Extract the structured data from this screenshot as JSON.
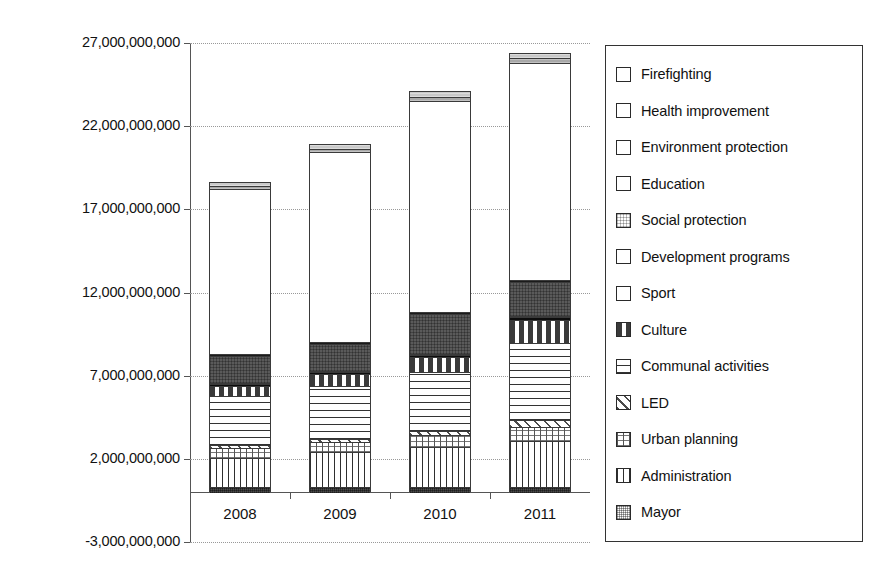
{
  "chart_data": {
    "type": "bar",
    "stacked": true,
    "title": "",
    "xlabel": "",
    "ylabel": "",
    "categories": [
      "2008",
      "2009",
      "2010",
      "2011"
    ],
    "ylim": [
      -3000000000,
      27000000000
    ],
    "ytick_values": [
      27000000000,
      22000000000,
      17000000000,
      12000000000,
      7000000000,
      2000000000,
      -3000000000
    ],
    "ytick_labels": [
      "27,000,000,000",
      "22,000,000,000",
      "17,000,000,000",
      "12,000,000,000",
      "7,000,000,000",
      "2,000,000,000",
      "-3,000,000,000"
    ],
    "grid": true,
    "legend_position": "right",
    "series": [
      {
        "name": "Mayor",
        "key": "mayor",
        "color": "#4a4a4a",
        "pattern": "solid-dark",
        "values": [
          300000000,
          300000000,
          320000000,
          330000000
        ]
      },
      {
        "name": "Administration",
        "key": "admin",
        "color": "#ffffff",
        "pattern": "vertical-lines",
        "values": [
          1750000000,
          2100000000,
          2380000000,
          2750000000
        ]
      },
      {
        "name": "Urban planning",
        "key": "urban",
        "color": "#ffffff",
        "pattern": "dotted-grid",
        "values": [
          600000000,
          600000000,
          720000000,
          840000000
        ]
      },
      {
        "name": "LED",
        "key": "led",
        "color": "#ffffff",
        "pattern": "diagonal-hatch",
        "values": [
          180000000,
          180000000,
          240000000,
          420000000
        ]
      },
      {
        "name": "Communal activities",
        "key": "communal",
        "color": "#ffffff",
        "pattern": "horizontal-lines",
        "values": [
          2950000000,
          3200000000,
          3550000000,
          4650000000
        ]
      },
      {
        "name": "Culture",
        "key": "culture",
        "color": "#ffffff",
        "pattern": "dash-marks",
        "values": [
          600000000,
          720000000,
          900000000,
          1380000000
        ]
      },
      {
        "name": "Sport",
        "key": "sport",
        "color": "#0d0d0d",
        "pattern": "solid-black",
        "values": [
          120000000,
          120000000,
          120000000,
          180000000
        ]
      },
      {
        "name": "Development programs",
        "key": "devprog",
        "color": "#9a9a9a",
        "pattern": "light-gray",
        "values": [
          60000000,
          60000000,
          60000000,
          60000000
        ]
      },
      {
        "name": "Social protection",
        "key": "social",
        "color": "#5a5a5a",
        "pattern": "dark-gray",
        "values": [
          1620000000,
          1620000000,
          2400000000,
          2040000000
        ]
      },
      {
        "name": "Environment protection",
        "key": "envprot",
        "color": "#1b1b1b",
        "pattern": "very-dark",
        "values": [
          120000000,
          120000000,
          120000000,
          120000000
        ]
      },
      {
        "name": "Education",
        "key": "education",
        "color": "#ffffff",
        "pattern": "white",
        "values": [
          9900000000,
          11400000000,
          12700000000,
          13050000000
        ]
      },
      {
        "name": "Health improvement",
        "key": "health",
        "color": "#a8a8a8",
        "pattern": "medium-gray",
        "values": [
          180000000,
          180000000,
          240000000,
          300000000
        ]
      },
      {
        "name": "Firefighting",
        "key": "fire",
        "color": "#c9c9c9",
        "pattern": "light-gray",
        "values": [
          240000000,
          300000000,
          360000000,
          300000000
        ]
      }
    ],
    "totals": [
      18620000000,
      20900000000,
      24110000000,
      26420000000
    ],
    "legend_order": [
      "Firefighting",
      "Health improvement",
      "Environment protection",
      "Education",
      "Social protection",
      "Development programs",
      "Sport",
      "Culture",
      "Communal activities",
      "LED",
      "Urban planning",
      "Administration",
      "Mayor"
    ]
  }
}
